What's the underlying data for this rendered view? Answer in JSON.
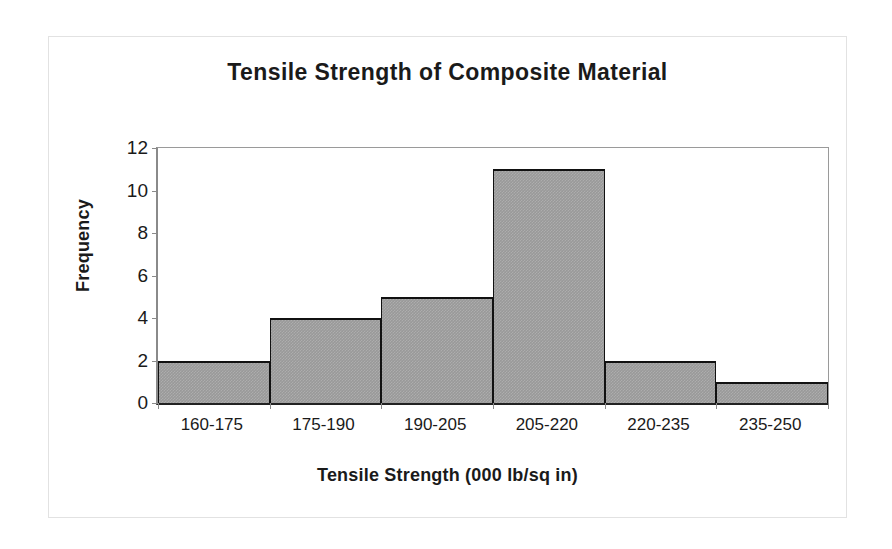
{
  "chart_data": {
    "type": "bar",
    "title": "Tensile Strength of Composite Material",
    "xlabel": "Tensile Strength (000 lb/sq in)",
    "ylabel": "Frequency",
    "categories": [
      "160-175",
      "175-190",
      "190-205",
      "205-220",
      "220-235",
      "235-250"
    ],
    "values": [
      2,
      4,
      5,
      11,
      2,
      1
    ],
    "ylim": [
      0,
      12
    ],
    "ytick_values": [
      0,
      2,
      4,
      6,
      8,
      10,
      12
    ],
    "ytick_labels": [
      "0",
      "2",
      "4",
      "6",
      "8",
      "10",
      "12"
    ],
    "grid": false,
    "legend": false,
    "bar_gap": 0,
    "colors": {
      "bar_fill": "#999999",
      "bar_border": "#111111",
      "axis": "#8a8a8a",
      "baseline": "#222222",
      "text": "#1a1a1a",
      "frame": "#e2e2e2",
      "background": "#ffffff"
    }
  }
}
